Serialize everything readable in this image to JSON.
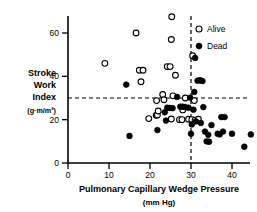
{
  "chart_data": {
    "type": "scatter",
    "title": "",
    "xlabel": "Pulmonary Capillary Wedge Pressure",
    "xlabel_units": "(mm Hg)",
    "ylabel_lines": [
      "Stroke",
      "Work",
      "Index"
    ],
    "ylabel_units": "(g·m/m²)",
    "xlim": [
      0,
      46
    ],
    "ylim": [
      0,
      72
    ],
    "xticks": [
      0,
      10,
      20,
      30,
      40
    ],
    "xtick_labels": [
      "0",
      "10",
      "20",
      "30",
      "40"
    ],
    "yticks": [
      0,
      20,
      40,
      60
    ],
    "ytick_labels": [
      "0",
      "20",
      "40",
      "60"
    ],
    "grid": false,
    "reference_lines": [
      {
        "orientation": "vertical",
        "value": 30,
        "style": "dashed"
      },
      {
        "orientation": "horizontal",
        "value": 30,
        "style": "dashed"
      }
    ],
    "legend": {
      "position": "top-right",
      "entries": [
        {
          "name": "Alive",
          "marker": "open-circle"
        },
        {
          "name": "Dead",
          "marker": "filled-circle"
        }
      ]
    },
    "series": [
      {
        "name": "Alive",
        "marker": "open-circle",
        "points": [
          [
            9.0,
            46.0
          ],
          [
            16.6,
            60.0
          ],
          [
            17.4,
            42.8
          ],
          [
            18.3,
            42.8
          ],
          [
            17.8,
            37.5
          ],
          [
            19.7,
            20.5
          ],
          [
            21.5,
            22.0
          ],
          [
            21.8,
            22.2
          ],
          [
            22.0,
            24.0
          ],
          [
            21.6,
            28.8
          ],
          [
            23.1,
            31.6
          ],
          [
            23.4,
            29.2
          ],
          [
            24.2,
            44.5
          ],
          [
            24.9,
            44.5
          ],
          [
            25.3,
            67.5
          ],
          [
            25.2,
            57.0
          ],
          [
            26.2,
            40.5
          ],
          [
            25.6,
            31.0
          ],
          [
            25.2,
            20.3
          ],
          [
            27.2,
            20.0
          ],
          [
            27.8,
            20.0
          ],
          [
            28.6,
            30.0
          ],
          [
            28.0,
            24.5
          ],
          [
            29.4,
            20.2
          ],
          [
            30.4,
            49.5
          ],
          [
            30.2,
            20.0
          ],
          [
            31.0,
            19.8
          ],
          [
            31.8,
            20.2
          ],
          [
            30.8,
            28.8
          ]
        ]
      },
      {
        "name": "Dead",
        "marker": "filled-circle",
        "points": [
          [
            14.2,
            36.2
          ],
          [
            15.0,
            12.5
          ],
          [
            21.8,
            15.2
          ],
          [
            23.9,
            19.6
          ],
          [
            23.6,
            23.4
          ],
          [
            24.2,
            25.5
          ],
          [
            24.8,
            25.4
          ],
          [
            25.5,
            25.3
          ],
          [
            26.6,
            30.5
          ],
          [
            27.4,
            26.0
          ],
          [
            28.0,
            26.0
          ],
          [
            28.6,
            25.8
          ],
          [
            29.4,
            25.5
          ],
          [
            29.8,
            30.2
          ],
          [
            30.0,
            13.5
          ],
          [
            30.2,
            17.8
          ],
          [
            30.6,
            24.6
          ],
          [
            30.8,
            32.8
          ],
          [
            31.0,
            48.5
          ],
          [
            31.2,
            19.2
          ],
          [
            31.6,
            38.0
          ],
          [
            32.2,
            38.2
          ],
          [
            32.8,
            37.8
          ],
          [
            32.4,
            18.5
          ],
          [
            33.0,
            25.8
          ],
          [
            33.4,
            14.5
          ],
          [
            33.8,
            10.0
          ],
          [
            34.4,
            9.8
          ],
          [
            34.2,
            13.0
          ],
          [
            35.0,
            17.5
          ],
          [
            36.5,
            13.5
          ],
          [
            37.0,
            13.2
          ],
          [
            37.4,
            21.2
          ],
          [
            38.2,
            21.2
          ],
          [
            37.8,
            14.5
          ],
          [
            40.0,
            13.5
          ],
          [
            43.0,
            7.5
          ],
          [
            44.6,
            13.2
          ]
        ]
      }
    ]
  }
}
